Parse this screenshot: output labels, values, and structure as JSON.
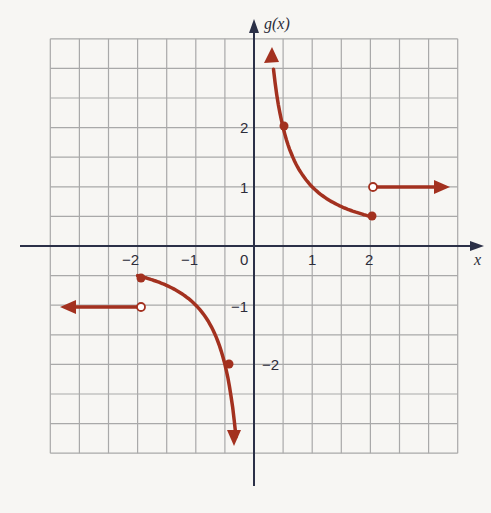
{
  "chart_data": {
    "type": "line",
    "title": "",
    "xlabel": "x",
    "ylabel": "g(x)",
    "xlim": [
      -3.5,
      3.5
    ],
    "ylim": [
      -3.5,
      3.5
    ],
    "grid": true,
    "grid_step": 0.5,
    "x_tick_labels": [
      {
        "value": -2,
        "label": "−2"
      },
      {
        "value": -1,
        "label": "−1"
      },
      {
        "value": 0,
        "label": "0"
      },
      {
        "value": 1,
        "label": "1"
      },
      {
        "value": 2,
        "label": "2"
      }
    ],
    "y_tick_labels": [
      {
        "value": 2,
        "label": "2"
      },
      {
        "value": 1,
        "label": "1"
      },
      {
        "value": -1,
        "label": "−1"
      },
      {
        "value": -2,
        "label": "−2"
      }
    ],
    "series": [
      {
        "name": "left constant branch",
        "definition": "g(x) = -1 for x < -2",
        "points": [
          [
            -3.3,
            -1
          ],
          [
            -2,
            -1
          ]
        ],
        "start_arrow": true,
        "end": "open",
        "arrow_direction": "left"
      },
      {
        "name": "left reciprocal branch",
        "definition": "g(x) = 1/x for -2 <= x < 0",
        "points": [
          [
            -2,
            -0.5
          ],
          [
            -1,
            -1
          ],
          [
            -0.5,
            -2
          ],
          [
            -0.35,
            -3.3
          ]
        ],
        "start": "closed",
        "arrow_direction": "down"
      },
      {
        "name": "right reciprocal branch",
        "definition": "g(x) = 1/x for 0 < x <= 2",
        "points": [
          [
            0.3,
            3.3
          ],
          [
            0.5,
            2
          ],
          [
            1,
            1
          ],
          [
            2,
            0.5
          ]
        ],
        "end": "closed",
        "arrow_direction": "up"
      },
      {
        "name": "right constant branch",
        "definition": "g(x) = 1 for x > 2",
        "points": [
          [
            2,
            1
          ],
          [
            3.3,
            1
          ]
        ],
        "start": "open",
        "arrow_direction": "right"
      }
    ],
    "marked_points": [
      {
        "x": -2,
        "y": -0.5,
        "style": "closed"
      },
      {
        "x": -2,
        "y": -1,
        "style": "open"
      },
      {
        "x": -0.5,
        "y": -2,
        "style": "closed"
      },
      {
        "x": 0.5,
        "y": 2,
        "style": "closed"
      },
      {
        "x": 2,
        "y": 0.5,
        "style": "closed"
      },
      {
        "x": 2,
        "y": 1,
        "style": "open"
      }
    ],
    "colors": {
      "curve": "#a3311f",
      "axes": "#2b3047",
      "grid": "#a9a9a9"
    }
  },
  "labels": {
    "x_axis": "x",
    "y_axis": "g(x)",
    "origin": "0",
    "x_neg2": "−2",
    "x_neg1": "−1",
    "x_1": "1",
    "x_2": "2",
    "y_2": "2",
    "y_1": "1",
    "y_neg1": "−1",
    "y_neg2": "−2"
  }
}
